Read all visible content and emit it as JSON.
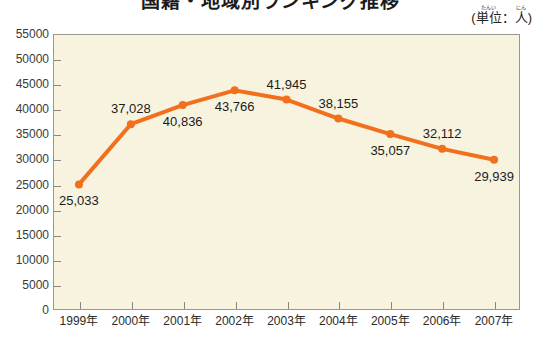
{
  "title": "国籍・地域別ランキング推移",
  "unit": {
    "open_paren": "(",
    "label_ruby": "たんい",
    "label_base": "単位",
    "colon": "：",
    "person_ruby": "にん",
    "person_base": "人",
    "close_paren": ")"
  },
  "colors": {
    "series": "#F2701D",
    "series_dark": "#E05A10",
    "plot_background": "#F7F3DF",
    "frame": "#9B978A",
    "page_background": "#FFFFFF",
    "text": "#231F20"
  },
  "chart_data": {
    "type": "line",
    "title": "国籍・地域別ランキング推移",
    "xlabel": "",
    "ylabel": "",
    "unit": "人",
    "grid": false,
    "legend": "none",
    "ylim": [
      0,
      55000
    ],
    "ytick_step": 5000,
    "categories": [
      "1999年",
      "2000年",
      "2001年",
      "2002年",
      "2003年",
      "2004年",
      "2005年",
      "2006年",
      "2007年"
    ],
    "yticks": [
      "0",
      "5000",
      "10000",
      "15000",
      "20000",
      "25000",
      "30000",
      "35000",
      "40000",
      "45000",
      "50000",
      "55000"
    ],
    "values": [
      25033,
      37028,
      40836,
      43766,
      41945,
      38155,
      35057,
      32112,
      29939
    ],
    "value_labels": [
      "25,033",
      "37,028",
      "40,836",
      "43,766",
      "41,945",
      "38,155",
      "35,057",
      "32,112",
      "29,939"
    ],
    "label_positions": [
      "below",
      "above",
      "below",
      "below",
      "above",
      "above",
      "below",
      "above",
      "below"
    ]
  }
}
